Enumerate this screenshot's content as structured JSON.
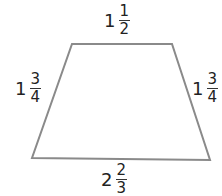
{
  "figure": {
    "shape": "trapezoid",
    "stroke_color": "#8a8a8a",
    "vertices": {
      "top_left": [
        72,
        44
      ],
      "top_right": [
        172,
        44
      ],
      "bottom_right": [
        210,
        160
      ],
      "bottom_left": [
        32,
        158
      ]
    }
  },
  "labels": {
    "top": {
      "whole": "1",
      "numerator": "1",
      "denominator": "2"
    },
    "left": {
      "whole": "1",
      "numerator": "3",
      "denominator": "4"
    },
    "right": {
      "whole": "1",
      "numerator": "3",
      "denominator": "4"
    },
    "bottom": {
      "whole": "2",
      "numerator": "2",
      "denominator": "3"
    }
  }
}
